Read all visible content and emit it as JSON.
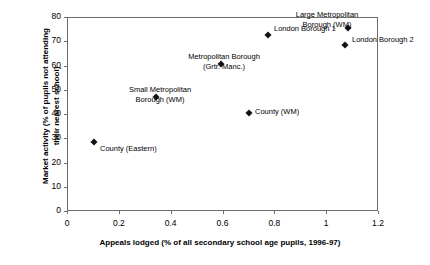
{
  "chart_data": {
    "type": "scatter",
    "title": "",
    "xlabel": "Appeals lodged (% of all secondary school age pupils, 1996-97)",
    "ylabel_line1": "Market activity (% of pupils not attending",
    "ylabel_line2": "their nearest school)",
    "xlim": [
      0,
      1.2
    ],
    "ylim": [
      0,
      80
    ],
    "xticks": [
      "0",
      "0.2",
      "0.4",
      "0.6",
      "0.8",
      "1",
      "1.2"
    ],
    "xtick_values": [
      0,
      0.2,
      0.4,
      0.6,
      0.8,
      1.0,
      1.2
    ],
    "yticks": [
      "0",
      "10",
      "20",
      "30",
      "40",
      "50",
      "60",
      "70",
      "80"
    ],
    "ytick_values": [
      0,
      10,
      20,
      30,
      40,
      50,
      60,
      70,
      80
    ],
    "grid": false,
    "legend": false,
    "marker_style": "filled-diamond",
    "marker_color": "#111111",
    "axis_color": "#6d6d6d",
    "points": [
      {
        "label_line1": "County (Eastern)",
        "label_line2": "",
        "x": 0.1,
        "y": 29,
        "label_align": "left",
        "label_left_px": 100,
        "label_top_px": 144
      },
      {
        "label_line1": "Small Metropolitan",
        "label_line2": "Borough (WM)",
        "x": 0.34,
        "y": 47.5,
        "label_align": "center",
        "label_left_px": 160,
        "label_top_px": 85
      },
      {
        "label_line1": "Metropolitan Borough",
        "label_line2": "(Grtr. Manc.)",
        "x": 0.59,
        "y": 61,
        "label_align": "center",
        "label_left_px": 224,
        "label_top_px": 52
      },
      {
        "label_line1": "County (WM)",
        "label_line2": "",
        "x": 0.7,
        "y": 41,
        "label_align": "left",
        "label_left_px": 255,
        "label_top_px": 107
      },
      {
        "label_line1": "London Borough 1",
        "label_line2": "",
        "x": 0.77,
        "y": 73,
        "label_align": "left",
        "label_left_px": 274,
        "label_top_px": 24
      },
      {
        "label_line1": "Large Metropolitan",
        "label_line2": "Borough (WM)",
        "x": 1.08,
        "y": 76,
        "label_align": "center",
        "label_left_px": 327,
        "label_top_px": 10
      },
      {
        "label_line1": "London Borough 2",
        "label_line2": "",
        "x": 1.07,
        "y": 69,
        "label_align": "left",
        "label_left_px": 352,
        "label_top_px": 35
      }
    ]
  }
}
